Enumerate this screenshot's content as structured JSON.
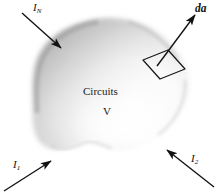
{
  "figure": {
    "background_color": "#ffffff",
    "ink_color": "#111111",
    "blob": {
      "name": "circuits-volume-blob",
      "fill_light": "#fdfdfd",
      "fill_mid": "#e2e2e2",
      "fill_dark": "#a9a9a9",
      "edge_shadow": "#8f8f8f"
    },
    "labels": {
      "volume_name": "Circuits",
      "volume_symbol": "V",
      "current_n": {
        "symbol": "I",
        "subscript": "N"
      },
      "current_1": {
        "symbol": "I",
        "subscript": "1"
      },
      "current_2": {
        "symbol": "I",
        "subscript": "2"
      },
      "area_vector": "da"
    },
    "arrows": [
      {
        "name": "current-arrow-IN",
        "label": "I_N",
        "direction": "into-volume",
        "from": [
          22,
          14
        ],
        "to": [
          62,
          49
        ]
      },
      {
        "name": "current-arrow-I1",
        "label": "I_1",
        "direction": "into-volume",
        "from": [
          5,
          192
        ],
        "to": [
          52,
          162
        ]
      },
      {
        "name": "current-arrow-I2",
        "label": "I_2",
        "direction": "into-volume",
        "from": [
          212,
          186
        ],
        "to": [
          168,
          150
        ]
      },
      {
        "name": "area-vector-arrow-da",
        "label": "da",
        "direction": "out-of-surface",
        "from": [
          157,
          65
        ],
        "to": [
          196,
          14
        ]
      }
    ],
    "surface_patch": {
      "name": "differential-surface-patch",
      "shape": "quadrilateral",
      "points": [
        [
          143,
          60
        ],
        [
          168,
          50
        ],
        [
          185,
          69
        ],
        [
          160,
          79
        ]
      ]
    }
  }
}
